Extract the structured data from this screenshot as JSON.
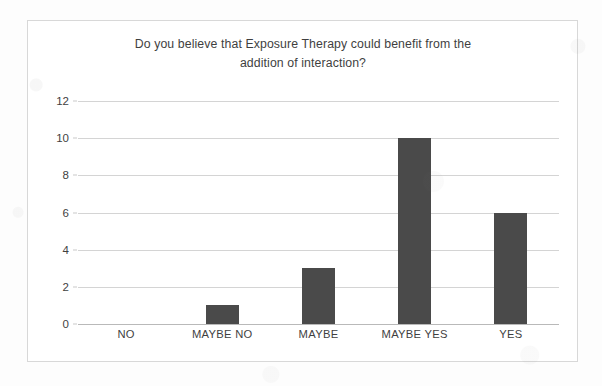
{
  "chart_data": {
    "type": "bar",
    "title": "Do you believe that Exposure Therapy could benefit from the addition of interaction?",
    "title_line1": "Do you believe that Exposure Therapy could benefit from the",
    "title_line2": "addition of interaction?",
    "categories": [
      "NO",
      "MAYBE NO",
      "MAYBE",
      "MAYBE YES",
      "YES"
    ],
    "values": [
      0,
      1,
      3,
      10,
      6
    ],
    "xlabel": "",
    "ylabel": "",
    "ylim": [
      0,
      12
    ],
    "ytick_labels": [
      "12",
      "10",
      "8",
      "6",
      "4",
      "2",
      "0"
    ],
    "ytick_values": [
      12,
      10,
      8,
      6,
      4,
      2,
      0
    ],
    "grid": true,
    "legend": false,
    "bar_color": "#4a4a4a",
    "gridline_color": "#d4d4d4",
    "border_color": "#d8d8d8",
    "text_color": "#3f3f3f",
    "background_color": "#ffffff"
  }
}
